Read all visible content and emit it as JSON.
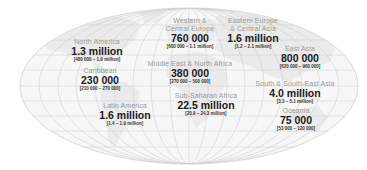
{
  "map": {
    "projection": "elliptical world map",
    "colors": {
      "land_fill": "#ebebeb",
      "ocean_fill": "#f7f7f7",
      "graticule": "#c8c8c8",
      "label_name": "#9a9a9a",
      "label_value": "#1a1a1a"
    }
  },
  "regions": [
    {
      "id": "north-america",
      "name": "North America",
      "value": "1.3 million",
      "range": "[480 000 – 1.9 million]"
    },
    {
      "id": "caribbean",
      "name": "Caribbean",
      "value": "230 000",
      "range": "[210 000 – 270 000]"
    },
    {
      "id": "latin-america",
      "name": "Latin America",
      "value": "1.6 million",
      "range": "[1.4 – 1.9 million]"
    },
    {
      "id": "western-central-europe",
      "name_line1": "Western &",
      "name_line2": "Central Europe",
      "value": "760 000",
      "range": "[600 000 – 1.1 million]"
    },
    {
      "id": "eastern-europe-central-asia",
      "name_line1": "Eastern Europe",
      "name_line2": "& Central Asia",
      "value": "1.6 million",
      "range": "[1.2 – 2.1 million]"
    },
    {
      "id": "middle-east-north-africa",
      "name": "Middle East & North Africa",
      "value": "380 000",
      "range": "[270 000 – 500 000]"
    },
    {
      "id": "sub-saharan-africa",
      "name": "Sub-Saharan Africa",
      "value": "22.5 million",
      "range": "[20.9 – 24.3 million]"
    },
    {
      "id": "east-asia",
      "name": "East Asia",
      "value": "800 000",
      "range": "[620 000 – 960 000]"
    },
    {
      "id": "south-southeast-asia",
      "name": "South & South-East Asia",
      "value": "4.0 million",
      "range": "[3.3 – 5.1 million]"
    },
    {
      "id": "oceania",
      "name": "Oceania",
      "value": "75 000",
      "range": "[53 000 – 120 000]"
    }
  ]
}
